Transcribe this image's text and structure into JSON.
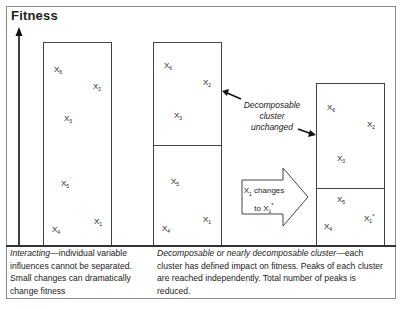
{
  "title": "Fitness",
  "panels": [
    {
      "id": "interacting",
      "variables": [
        {
          "name": "X",
          "sub": "6",
          "sup": ""
        },
        {
          "name": "X",
          "sub": "2",
          "sup": ""
        },
        {
          "name": "X",
          "sub": "3",
          "sup": ""
        },
        {
          "name": "X",
          "sub": "5",
          "sup": ""
        },
        {
          "name": "X",
          "sub": "4",
          "sup": ""
        },
        {
          "name": "X",
          "sub": "1",
          "sup": ""
        }
      ]
    },
    {
      "id": "decomposable-before",
      "variables": [
        {
          "name": "X",
          "sub": "6",
          "sup": ""
        },
        {
          "name": "X",
          "sub": "2",
          "sup": ""
        },
        {
          "name": "X",
          "sub": "3",
          "sup": ""
        },
        {
          "name": "X",
          "sub": "5",
          "sup": ""
        },
        {
          "name": "X",
          "sub": "4",
          "sup": ""
        },
        {
          "name": "X",
          "sub": "1",
          "sup": ""
        }
      ]
    },
    {
      "id": "decomposable-after",
      "variables": [
        {
          "name": "X",
          "sub": "6",
          "sup": ""
        },
        {
          "name": "X",
          "sub": "2",
          "sup": ""
        },
        {
          "name": "X",
          "sub": "3",
          "sup": ""
        },
        {
          "name": "X",
          "sub": "5",
          "sup": ""
        },
        {
          "name": "X",
          "sub": "4",
          "sup": ""
        },
        {
          "name": "X",
          "sub": "1",
          "sup": "*"
        }
      ]
    }
  ],
  "annotation": {
    "line1": "Decomposable",
    "line2": "cluster",
    "line3": "unchanged"
  },
  "change_arrow": {
    "line1_var": "X",
    "line1_sub": "1",
    "line1_text": " changes",
    "line2_text": "to X",
    "line2_sub": "1",
    "line2_sup": "*"
  },
  "captions": {
    "left": {
      "emphasis": "Interacting",
      "text": "—individual variable influences cannot be separated. Small changes can dramatically change fitness"
    },
    "right": {
      "emphasis": "Decomposable or nearly decomposable cluster",
      "text": "—each cluster has defined impact on fitness.  Peaks of each cluster are reached independently. Total number of peaks is reduced."
    }
  },
  "colors": {
    "stroke": "#444444",
    "text": "#222222",
    "frame": "#8a8a8a"
  }
}
